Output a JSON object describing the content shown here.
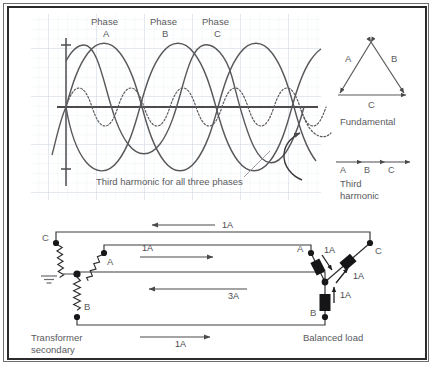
{
  "waveform": {
    "phase_labels": [
      {
        "line1": "Phase",
        "line2": "A"
      },
      {
        "line1": "Phase",
        "line2": "B"
      },
      {
        "line1": "Phase",
        "line2": "C"
      }
    ],
    "annotation": "Third harmonic for all three phases"
  },
  "legend": {
    "fundamental": {
      "caption": "Fundamental",
      "side_a": "A",
      "side_b": "B",
      "side_c": "C"
    },
    "third_harmonic": {
      "caption_line1": "Third",
      "caption_line2": "harmonic",
      "a": "A",
      "b": "B",
      "c": "C"
    }
  },
  "circuit": {
    "source_label_line1": "Transformer",
    "source_label_line2": "secondary",
    "load_label": "Balanced load",
    "source_terminals": {
      "a": "A",
      "b": "B",
      "c": "C"
    },
    "load_terminals": {
      "a": "A",
      "b": "B",
      "c": "C"
    },
    "currents": {
      "line_c": "1A",
      "line_a": "1A",
      "neutral": "3A",
      "line_b": "1A",
      "load_a": "1A",
      "load_c": "1A",
      "load_b": "1A"
    }
  },
  "colors": {
    "border_dark": "#2b2b2e",
    "border_light": "#6f6f72",
    "grid": "#dfe4ea",
    "grid_major": "#ccd4dd",
    "curve": "#58585b",
    "text": "#5a5a5d",
    "wire": "#3c3c3f",
    "component_fill": "#151517",
    "background": "#ffffff"
  }
}
